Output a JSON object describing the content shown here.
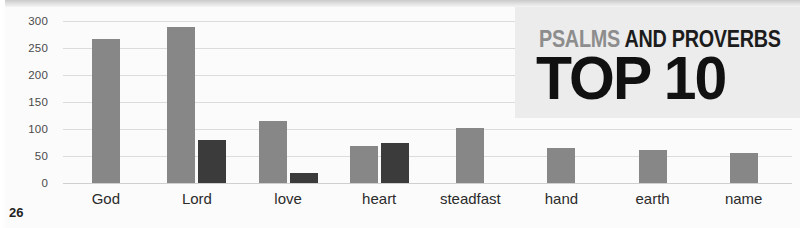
{
  "page": {
    "number": "26"
  },
  "title_panel": {
    "line1_light": "PSALMS",
    "line1_dark": " AND PROVERBS",
    "line2": "TOP 10",
    "background": "#ececec"
  },
  "colors": {
    "series_light": "#878787",
    "series_dark": "#3b3b3b",
    "gridline": "#dcdcdc",
    "text": "#2b2b2b",
    "canvas": "#fbfbfb"
  },
  "chart_data": {
    "type": "bar",
    "title": "PSALMS AND PROVERBS TOP 10",
    "xlabel": "",
    "ylabel": "",
    "ylim": [
      0,
      300
    ],
    "yticks": [
      0,
      50,
      100,
      150,
      200,
      250,
      300
    ],
    "ytick_labels": [
      "0",
      "50",
      "100",
      "150",
      "200",
      "250",
      "300"
    ],
    "grid": true,
    "legend": "none",
    "categories": [
      "God",
      "Lord",
      "love",
      "heart",
      "steadfast",
      "hand",
      "earth",
      "name"
    ],
    "series": [
      {
        "name": "Psalms",
        "color": "#878787",
        "values": [
          266,
          288,
          115,
          68,
          101,
          65,
          62,
          56
        ]
      },
      {
        "name": "Proverbs",
        "color": "#3b3b3b",
        "values": [
          0,
          80,
          18,
          74,
          0,
          0,
          0,
          0
        ]
      }
    ]
  }
}
